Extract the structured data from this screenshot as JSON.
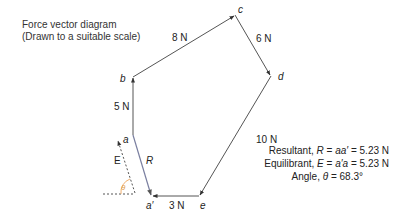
{
  "title": {
    "line1": "Force vector diagram",
    "line2": "(Drawn to a suitable scale)"
  },
  "vertices": {
    "a": "a",
    "b": "b",
    "c": "c",
    "d": "d",
    "e": "e",
    "a_prime": "a′"
  },
  "forces": [
    {
      "from": "a",
      "to": "b",
      "label": "5 N"
    },
    {
      "from": "b",
      "to": "c",
      "label": "8 N"
    },
    {
      "from": "c",
      "to": "d",
      "label": "6 N"
    },
    {
      "from": "d",
      "to": "e",
      "label": "10 N"
    },
    {
      "from": "e",
      "to": "a′",
      "label": "3 N"
    }
  ],
  "resultant_label": "R",
  "equilibrant_label": "E",
  "angle_label": "θ",
  "results": {
    "resultant_prefix": "Resultant, ",
    "resultant_sym": "R",
    "resultant_eq": " = ",
    "resultant_vec": "aa′",
    "resultant_val": " = 5.23 N",
    "equilibrant_prefix": "Equilibrant, ",
    "equilibrant_sym": "E",
    "equilibrant_eq": " = ",
    "equilibrant_vec": "a′a",
    "equilibrant_val": " = 5.23 N",
    "angle_prefix": "Angle, ",
    "angle_sym": "θ",
    "angle_val": " = 68.3°"
  },
  "colors": {
    "vector": "#555555",
    "resultant": "#7a7fa0",
    "angle_arc": "#f0b070",
    "angle_text": "#e0a050"
  }
}
